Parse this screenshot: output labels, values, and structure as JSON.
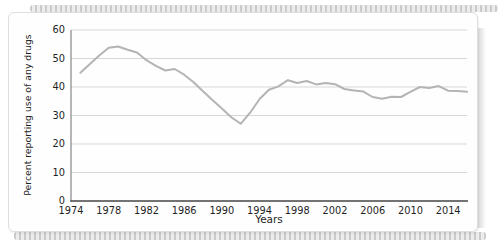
{
  "chart_data": {
    "type": "line",
    "title": "",
    "xlabel": "Years",
    "ylabel": "Percent reporting use of any drugs",
    "xlim": [
      1974,
      2016
    ],
    "ylim": [
      0,
      60
    ],
    "x_ticks": [
      1974,
      1978,
      1982,
      1986,
      1990,
      1994,
      1998,
      2002,
      2006,
      2010,
      2014
    ],
    "y_ticks": [
      0,
      10,
      20,
      30,
      40,
      50,
      60
    ],
    "grid": true,
    "legend_position": "none",
    "line_color": "#b4b4b6",
    "series": [
      {
        "name": "Percent reporting use of any drugs",
        "x": [
          1975,
          1976,
          1977,
          1978,
          1979,
          1980,
          1981,
          1982,
          1983,
          1984,
          1985,
          1986,
          1987,
          1988,
          1989,
          1990,
          1991,
          1992,
          1993,
          1994,
          1995,
          1996,
          1997,
          1998,
          1999,
          2000,
          2001,
          2002,
          2003,
          2004,
          2005,
          2006,
          2007,
          2008,
          2009,
          2010,
          2011,
          2012,
          2013,
          2014,
          2015,
          2016
        ],
        "values": [
          45.0,
          48.1,
          51.1,
          53.8,
          54.2,
          53.1,
          52.1,
          49.4,
          47.4,
          45.8,
          46.3,
          44.3,
          41.7,
          38.5,
          35.4,
          32.5,
          29.4,
          27.1,
          31.0,
          35.8,
          39.0,
          40.2,
          42.4,
          41.4,
          42.1,
          40.9,
          41.4,
          41.0,
          39.3,
          38.8,
          38.4,
          36.5,
          35.9,
          36.6,
          36.5,
          38.3,
          40.0,
          39.7,
          40.3,
          38.7,
          38.6,
          38.3
        ]
      }
    ]
  },
  "colors": {
    "grid": "#d7d7d7",
    "x_axis": "#454545",
    "y_axis": "#8f8f8f",
    "tick_text": "#1f1f1f"
  }
}
